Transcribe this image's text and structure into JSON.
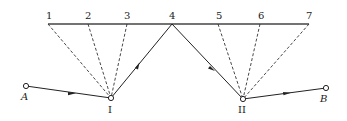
{
  "diagram": {
    "top_line": {
      "x1": 48,
      "x2": 309,
      "y": 24
    },
    "top_points": [
      {
        "label": "1",
        "x": 48
      },
      {
        "label": "2",
        "x": 88
      },
      {
        "label": "3",
        "x": 127
      },
      {
        "label": "4",
        "x": 172
      },
      {
        "label": "5",
        "x": 218
      },
      {
        "label": "6",
        "x": 260
      },
      {
        "label": "7",
        "x": 309
      }
    ],
    "nodes": {
      "A": {
        "label": "A",
        "x": 26,
        "y": 86
      },
      "I": {
        "label": "I",
        "x": 111,
        "y": 98
      },
      "II": {
        "label": "II",
        "x": 243,
        "y": 99
      },
      "B": {
        "label": "B",
        "x": 326,
        "y": 88
      }
    },
    "solid_path": [
      "A",
      "I",
      "4",
      "II",
      "B"
    ],
    "dashed_from_I": [
      "1",
      "2",
      "3"
    ],
    "dashed_from_II": [
      "5",
      "6",
      "7"
    ],
    "colors": {
      "line": "#333333",
      "background": "#ffffff"
    }
  }
}
